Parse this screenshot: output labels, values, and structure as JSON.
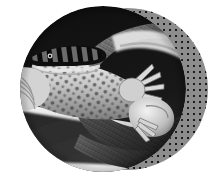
{
  "graphic": {
    "title": "Circular black-and-white wildlife photograph",
    "subject": "Snake coiled around a spotted lizard",
    "style": "duotone-halftone-collage",
    "background_color": "#ffffff",
    "photo": {
      "shape": "circle",
      "treatment": "black-and-white",
      "alt_text": "Black and white close-up of a banded snake gripping a spotted gecko in its jaws",
      "diameter_px": 166,
      "position": {
        "x": 20,
        "y": 6
      },
      "tones": {
        "darkest": "#111111",
        "dark": "#2f2f2f",
        "mid": "#7a7a7a",
        "light": "#cfcfcf",
        "lightest": "#f4f4f4"
      }
    },
    "backdrop": {
      "shape": "circle",
      "fill_color": "#8d8d8d",
      "dot_color": "#1b1b1b",
      "dot_spacing_px": 6,
      "dot_radius_px": 1,
      "diameter_px": 162,
      "position": {
        "x": 46,
        "y": 8
      }
    }
  }
}
